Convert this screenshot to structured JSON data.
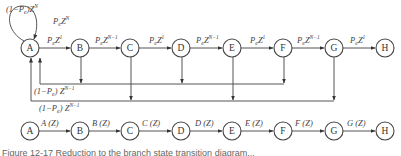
{
  "diagram": {
    "top_row": {
      "nodes": [
        "A",
        "B",
        "C",
        "D",
        "E",
        "F",
        "G",
        "H"
      ],
      "edge_labels": [
        "P_eZ^1",
        "P_eZ^(N-1)",
        "P_eZ^1",
        "P_eZ^(N-1)",
        "P_eZ^1",
        "P_eZ^(N-1)",
        "P_eZ^1"
      ],
      "self_loop_label": "(1-P_e)Z^N",
      "self_loop_label_parts": {
        "a": "(1−",
        "b": "P",
        "sub": "e",
        "c": ")Z",
        "sup": "N"
      },
      "skip_label": {
        "b": "P",
        "sub": "e",
        "c": "Z",
        "sup": "N"
      },
      "return_label_upper": {
        "a": "(1−",
        "b": "P",
        "sub": "e",
        "c": ") Z",
        "sup": "N−1"
      },
      "return_label_lower": {
        "a": "(1−",
        "b": "P",
        "sub": "e",
        "c": ") Z",
        "sup": "N−1"
      },
      "edge_parts": [
        {
          "b": "P",
          "sub": "e",
          "c": "Z",
          "sup": "1"
        },
        {
          "b": "P",
          "sub": "e",
          "c": "Z",
          "sup": "N−1"
        },
        {
          "b": "P",
          "sub": "e",
          "c": "Z",
          "sup": "1"
        },
        {
          "b": "P",
          "sub": "e",
          "c": "Z",
          "sup": "N−1"
        },
        {
          "b": "P",
          "sub": "e",
          "c": "Z",
          "sup": "1"
        },
        {
          "b": "P",
          "sub": "e",
          "c": "Z",
          "sup": "N−1"
        },
        {
          "b": "P",
          "sub": "e",
          "c": "Z",
          "sup": "1"
        }
      ]
    },
    "bottom_row": {
      "nodes": [
        "A",
        "B",
        "C",
        "D",
        "E",
        "F",
        "G",
        "H"
      ],
      "edge_labels": [
        "A (Z)",
        "B (Z)",
        "C (Z)",
        "D (Z)",
        "E (Z)",
        "F (Z)",
        "G (Z)"
      ]
    },
    "caption": "Figure 12-17  Reduction to the branch state transition diagram..."
  }
}
